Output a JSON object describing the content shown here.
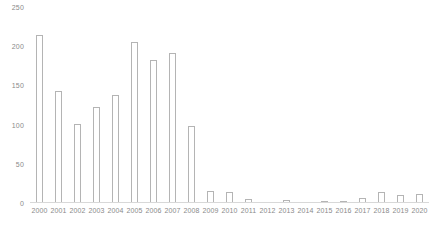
{
  "chart_data": {
    "type": "bar",
    "title": "",
    "subtitle": "",
    "xlabel": "",
    "ylabel": "",
    "legend": [],
    "legend_position": "none",
    "grid": false,
    "ylim": [
      0,
      250
    ],
    "yticks": [
      0,
      50,
      100,
      150,
      200,
      250
    ],
    "ytick_labels": [
      "0",
      "50",
      "100",
      "150",
      "200",
      "250"
    ],
    "categories": [
      "2000",
      "2001",
      "2002",
      "2003",
      "2004",
      "2005",
      "2006",
      "2007",
      "2008",
      "2009",
      "2010",
      "2011",
      "2012",
      "2013",
      "2014",
      "2015",
      "2016",
      "2017",
      "2018",
      "2019",
      "2020"
    ],
    "values": [
      214,
      143,
      101,
      122,
      138,
      205,
      183,
      191,
      98,
      15,
      14,
      5,
      0,
      4,
      0,
      2,
      3,
      7,
      14,
      10,
      11
    ],
    "bar_style": {
      "fill": "#ffffff",
      "edge": "#b4b4b4",
      "edge_width": 1
    },
    "axis_color": "#d8d8d8",
    "tick_label_color": "#8a8a8a"
  }
}
